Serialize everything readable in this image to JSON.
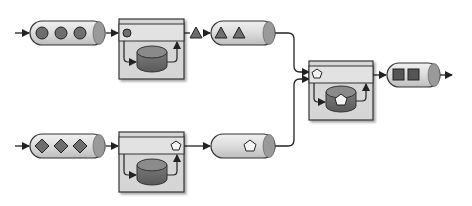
{
  "diagram": {
    "kind": "stream-processing-pipeline",
    "colors": {
      "background": "#ffffff",
      "stroke": "#333333",
      "queue_fill": "#dcdcdc",
      "queue_end": "#9a9a9a",
      "processor_fill": "#d6d6d6",
      "processor_header": "#e2e2e2",
      "store_top": "#8a8a8a",
      "store_body": "#6a6a6a",
      "item_fill": "#6e6e6e",
      "pentagon_fill": "#f4f4f4"
    },
    "nodes": [
      {
        "id": "input-queue-top",
        "type": "queue",
        "items": [
          "circle",
          "circle",
          "circle"
        ]
      },
      {
        "id": "processor-top",
        "type": "processor",
        "current_item": "circle",
        "emits": "triangle"
      },
      {
        "id": "output-queue-top",
        "type": "queue",
        "items": [
          "triangle",
          "triangle"
        ]
      },
      {
        "id": "input-queue-bottom",
        "type": "queue",
        "items": [
          "diamond",
          "diamond",
          "diamond"
        ]
      },
      {
        "id": "processor-bottom",
        "type": "processor",
        "current_item": "pentagon"
      },
      {
        "id": "output-queue-bottom",
        "type": "queue",
        "items": [
          "pentagon"
        ]
      },
      {
        "id": "processor-merge",
        "type": "processor",
        "current_item": "pentagon",
        "stored_item": "pentagon"
      },
      {
        "id": "output-queue-final",
        "type": "queue",
        "items": [
          "square",
          "square"
        ]
      }
    ],
    "edges": [
      {
        "from": "input",
        "to": "input-queue-top"
      },
      {
        "from": "input-queue-top",
        "to": "processor-top"
      },
      {
        "from": "processor-top",
        "to": "output-queue-top"
      },
      {
        "from": "input",
        "to": "input-queue-bottom"
      },
      {
        "from": "input-queue-bottom",
        "to": "processor-bottom"
      },
      {
        "from": "processor-bottom",
        "to": "output-queue-bottom"
      },
      {
        "from": "output-queue-top",
        "to": "processor-merge"
      },
      {
        "from": "output-queue-bottom",
        "to": "processor-merge"
      },
      {
        "from": "processor-merge",
        "to": "output-queue-final"
      },
      {
        "from": "output-queue-final",
        "to": "output"
      }
    ]
  }
}
